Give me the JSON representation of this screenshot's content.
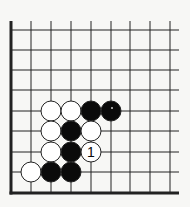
{
  "diagram": {
    "type": "go-board-corner",
    "corner": "bottom-left",
    "grid": {
      "columns_x": [
        11,
        31,
        51,
        71,
        91,
        111,
        130,
        150,
        170
      ],
      "rows_y": [
        30,
        50,
        70,
        90,
        111,
        131,
        152,
        172,
        193
      ],
      "line_top": 21,
      "line_right": 179,
      "edge_left": 11,
      "edge_bottom": 193
    },
    "stone_radius": 10,
    "colors": {
      "background": "#f7f7f5",
      "line": "#222222",
      "black": "#0a0a0a",
      "white": "#ffffff"
    },
    "stones": [
      {
        "color": "white",
        "col": 2,
        "row": 4,
        "label": ""
      },
      {
        "color": "white",
        "col": 3,
        "row": 4,
        "label": ""
      },
      {
        "color": "black",
        "col": 4,
        "row": 4,
        "label": ""
      },
      {
        "color": "black",
        "col": 5,
        "row": 4,
        "label": "",
        "mark": "dot"
      },
      {
        "color": "white",
        "col": 2,
        "row": 5,
        "label": ""
      },
      {
        "color": "black",
        "col": 3,
        "row": 5,
        "label": ""
      },
      {
        "color": "white",
        "col": 4,
        "row": 5,
        "label": ""
      },
      {
        "color": "white",
        "col": 2,
        "row": 6,
        "label": ""
      },
      {
        "color": "black",
        "col": 3,
        "row": 6,
        "label": ""
      },
      {
        "color": "white",
        "col": 4,
        "row": 6,
        "label": "1"
      },
      {
        "color": "white",
        "col": 1,
        "row": 7,
        "label": ""
      },
      {
        "color": "black",
        "col": 2,
        "row": 7,
        "label": ""
      },
      {
        "color": "black",
        "col": 3,
        "row": 7,
        "label": ""
      }
    ]
  }
}
